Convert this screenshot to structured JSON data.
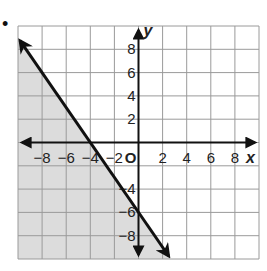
{
  "bullet": "•",
  "chart_data": {
    "type": "line",
    "title": "",
    "xlabel": "x",
    "ylabel": "y",
    "origin_label": "O",
    "xlim": [
      -10,
      10
    ],
    "ylim": [
      -10,
      10
    ],
    "grid": true,
    "grid_step": 2,
    "x_ticks": [
      -8,
      -6,
      -4,
      -2,
      2,
      4,
      6,
      8
    ],
    "y_ticks": [
      8,
      6,
      4,
      2,
      -4,
      -6,
      -8
    ],
    "x_tick_labels": [
      "−8",
      "−6",
      "−4",
      "−2",
      "2",
      "4",
      "6",
      "8"
    ],
    "y_tick_labels": [
      "8",
      "6",
      "4",
      "2",
      "−4",
      "−6",
      "−8"
    ],
    "series": [
      {
        "name": "boundary line",
        "style": "solid",
        "color": "#111111",
        "equation": "y = -1.5x - 6",
        "points": [
          [
            -10,
            9
          ],
          [
            -4,
            0
          ],
          [
            0,
            -6
          ],
          [
            2.67,
            -10
          ]
        ],
        "arrows": "both"
      }
    ],
    "shaded_region": {
      "side": "below-left of line",
      "inequality": "y ≤ -1.5x - 6",
      "color": "#dcdcdc"
    }
  },
  "colors": {
    "grid": "#9a9a9a",
    "axes": "#111111",
    "shade": "#dcdcdc",
    "line": "#111111"
  }
}
